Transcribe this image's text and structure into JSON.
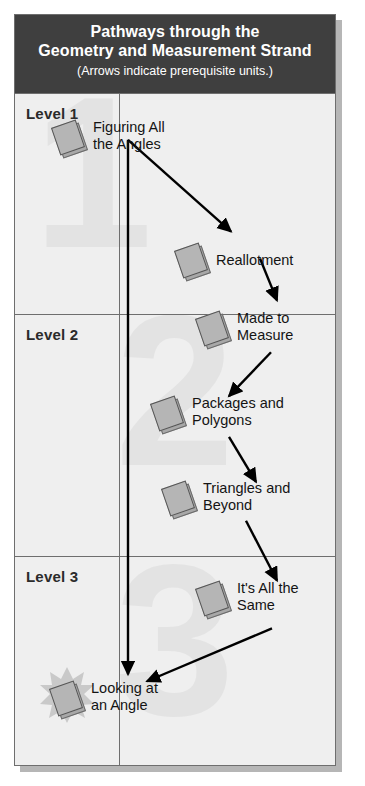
{
  "header": {
    "title_line1": "Pathways through the",
    "title_line2": "Geometry and Measurement Strand",
    "subtitle": "(Arrows indicate prerequisite units.)",
    "bg_color": "#3f3f3f",
    "text_color": "#ffffff"
  },
  "levels": [
    {
      "label": "Level 1",
      "watermark": "1"
    },
    {
      "label": "Level 2",
      "watermark": "2"
    },
    {
      "label": "Level 3",
      "watermark": "3"
    }
  ],
  "units": [
    {
      "id": "figuring",
      "label": "Figuring All\nthe Angles",
      "level": 1,
      "highlight": false
    },
    {
      "id": "reallotment",
      "label": "Reallotment",
      "level": 1,
      "highlight": false
    },
    {
      "id": "made",
      "label": "Made to\nMeasure",
      "level": 2,
      "highlight": false
    },
    {
      "id": "packages",
      "label": "Packages and\nPolygons",
      "level": 2,
      "highlight": false
    },
    {
      "id": "triangles",
      "label": "Triangles and\nBeyond",
      "level": 2,
      "highlight": false
    },
    {
      "id": "same",
      "label": "It's All the\nSame",
      "level": 3,
      "highlight": false
    },
    {
      "id": "looking",
      "label": "Looking at\nan Angle",
      "level": 3,
      "highlight": true
    }
  ],
  "connections": [
    {
      "from": "figuring",
      "to": "reallotment"
    },
    {
      "from": "figuring",
      "to": "looking"
    },
    {
      "from": "reallotment",
      "to": "made"
    },
    {
      "from": "made",
      "to": "packages"
    },
    {
      "from": "packages",
      "to": "triangles"
    },
    {
      "from": "triangles",
      "to": "same"
    },
    {
      "from": "same",
      "to": "looking"
    }
  ],
  "colors": {
    "panel_bg": "#efefef",
    "border": "#6e6e6e",
    "book_fill": "#b5b5b5",
    "arrow": "#000000",
    "watermark": "#e3e3e3"
  }
}
